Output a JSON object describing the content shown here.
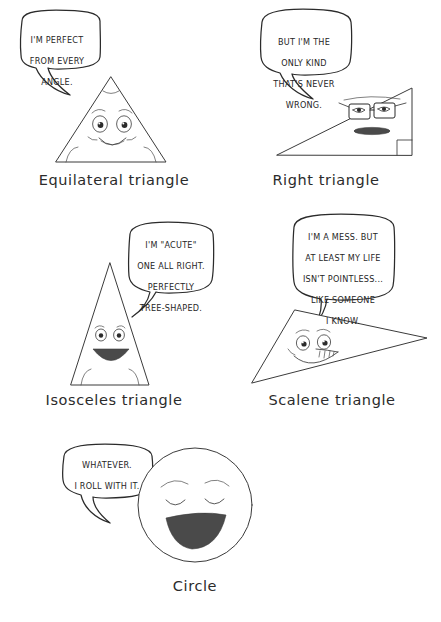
{
  "page": {
    "background_color": "#ffffff",
    "ink_color": "#2b2b2b",
    "mouth_fill_color": "#4a4a4a",
    "title_alt": "Cartoon triangles and a circle with speech bubbles"
  },
  "panels": [
    {
      "id": "equilateral",
      "caption": "Equilateral triangle",
      "speech": "I'm perfect from every angle.",
      "speech_lines": [
        "I'M PERFECT",
        "FROM EVERY",
        "ANGLE."
      ],
      "shape": "equilateral-triangle",
      "expression": "happy smile, rosy cheeks, angle arcs at all three corners"
    },
    {
      "id": "right",
      "caption": "Right triangle",
      "speech": "But I'm the only kind that's never wrong.",
      "speech_lines": [
        "BUT I'M THE",
        "ONLY KIND",
        "THAT'S NEVER",
        "WRONG."
      ],
      "shape": "right-triangle",
      "expression": "smug, rectangular eyeglasses, flat dark mouth, right-angle square marker"
    },
    {
      "id": "isosceles",
      "caption": "Isosceles triangle",
      "speech": "I'm \"acute\" one all right. Perfectly tree-shaped.",
      "speech_lines": [
        "I'M \"ACUTE\"",
        "ONE ALL RIGHT.",
        "PERFECTLY",
        "TREE-SHAPED."
      ],
      "shape": "isosceles-triangle",
      "expression": "cheerful, wide dark triangular smile, base angle arcs"
    },
    {
      "id": "scalene",
      "caption": "Scalene triangle",
      "speech": "I'm a mess. But at least my life isn't pointless... like someone I know.",
      "speech_lines": [
        "I'M A MESS. BUT",
        "AT LEAST MY LIFE",
        "ISN'T POINTLESS...",
        "LIKE SOMEONE",
        "I KNOW."
      ],
      "shape": "scalene-triangle",
      "expression": "nervous grin with teeth, eyes looking sideways"
    },
    {
      "id": "circle",
      "caption": "Circle",
      "speech": "Whatever. I roll with it.",
      "speech_lines": [
        "WHATEVER.",
        "I ROLL WITH IT."
      ],
      "shape": "circle",
      "expression": "serene closed eyes, wide open dark smile"
    }
  ]
}
